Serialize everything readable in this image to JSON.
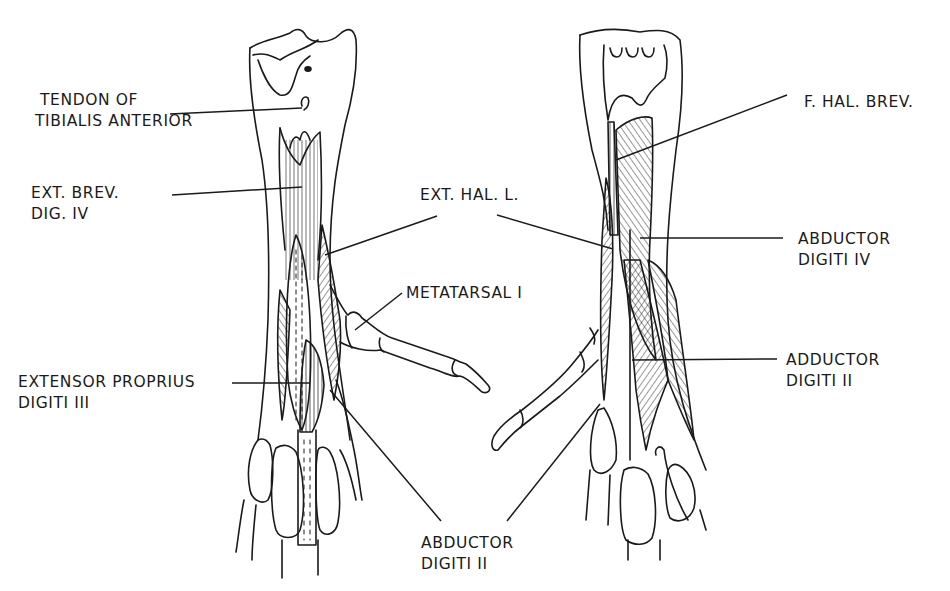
{
  "figure": {
    "ink_color": "#1a1a1a",
    "background": "#ffffff"
  },
  "labels": {
    "tendon_tibialis_anterior": {
      "line1": "TENDON OF",
      "line2": "TIBIALIS ANTERIOR"
    },
    "ext_brev_dig_iv": {
      "line1": "EXT. BREV.",
      "line2": "DIG. IV"
    },
    "ext_hal_l": {
      "line1": "EXT. HAL. L."
    },
    "metatarsal_i": {
      "line1": "METATARSAL I"
    },
    "extensor_proprius_digiti_iii": {
      "line1": "EXTENSOR PROPRIUS",
      "line2": "DIGITI III"
    },
    "abductor_digiti_ii": {
      "line1": "ABDUCTOR",
      "line2": "DIGITI II"
    },
    "f_hal_brev": {
      "line1": "F. HAL. BREV."
    },
    "abductor_digiti_iv": {
      "line1": "ABDUCTOR",
      "line2": "DIGITI IV"
    },
    "adductor_digiti_ii": {
      "line1": "ADDUCTOR",
      "line2": "DIGITI II"
    }
  }
}
